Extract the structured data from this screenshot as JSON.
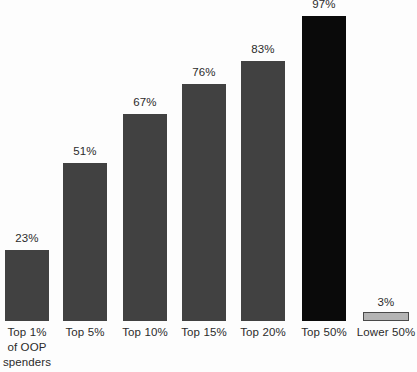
{
  "chart_data": {
    "type": "bar",
    "title": "",
    "subtitle": "",
    "xlabel": "",
    "ylabel": "",
    "ylim": [
      0,
      100
    ],
    "grid": false,
    "legend": "none",
    "value_suffix": "%",
    "categories": [
      "Top 1% of OOP spenders",
      "Top 5%",
      "Top 10%",
      "Top 15%",
      "Top 20%",
      "Top 50%",
      "Lower 50%"
    ],
    "category_lines": [
      [
        "Top 1%",
        "of OOP",
        "spenders"
      ],
      [
        "Top 5%"
      ],
      [
        "Top 10%"
      ],
      [
        "Top 15%"
      ],
      [
        "Top 20%"
      ],
      [
        "Top 50%"
      ],
      [
        "Lower 50%"
      ]
    ],
    "values": [
      23,
      51,
      67,
      76,
      83,
      97,
      3
    ],
    "value_labels": [
      "23%",
      "51%",
      "67%",
      "76%",
      "83%",
      "97%",
      "3%"
    ],
    "bar_colors": [
      "#414141",
      "#414141",
      "#414141",
      "#414141",
      "#414141",
      "#0a0a0a",
      "#b4b4b4"
    ],
    "bar_styles": [
      "fill-dark",
      "fill-dark",
      "fill-dark",
      "fill-dark",
      "fill-dark",
      "fill-black",
      "fill-light"
    ],
    "background_color": "#fdfdfd",
    "text_color": "#2b2b2b"
  },
  "bars": [
    {
      "id": "bar-top-1-pct",
      "value_label": "23%",
      "label_lines": [
        "Top 1%",
        "of OOP",
        "spenders"
      ],
      "left": 5,
      "width": 44,
      "top": 250,
      "height": 71,
      "value_top": 232,
      "label_top": 325,
      "style": "fill-dark"
    },
    {
      "id": "bar-top-5-pct",
      "value_label": "51%",
      "label_lines": [
        "Top 5%"
      ],
      "left": 63,
      "width": 44,
      "top": 163,
      "height": 158,
      "value_top": 145,
      "label_top": 325,
      "style": "fill-dark"
    },
    {
      "id": "bar-top-10-pct",
      "value_label": "67%",
      "label_lines": [
        "Top 10%"
      ],
      "left": 123,
      "width": 44,
      "top": 114,
      "height": 207,
      "value_top": 96,
      "label_top": 325,
      "style": "fill-dark"
    },
    {
      "id": "bar-top-15-pct",
      "value_label": "76%",
      "label_lines": [
        "Top 15%"
      ],
      "left": 182,
      "width": 44,
      "top": 84,
      "height": 237,
      "value_top": 66,
      "label_top": 325,
      "style": "fill-dark"
    },
    {
      "id": "bar-top-20-pct",
      "value_label": "83%",
      "label_lines": [
        "Top 20%"
      ],
      "left": 241,
      "width": 44,
      "top": 61,
      "height": 260,
      "value_top": 43,
      "label_top": 325,
      "style": "fill-dark"
    },
    {
      "id": "bar-top-50-pct",
      "value_label": "97%",
      "label_lines": [
        "Top 50%"
      ],
      "left": 302,
      "width": 44,
      "top": 16,
      "height": 305,
      "value_top": -2,
      "label_top": 325,
      "style": "fill-black"
    },
    {
      "id": "bar-lower-50-pct",
      "value_label": "3%",
      "label_lines": [
        "Lower 50%"
      ],
      "left": 363,
      "width": 46,
      "top": 312,
      "height": 9,
      "value_top": 296,
      "label_top": 325,
      "style": "fill-light"
    }
  ]
}
